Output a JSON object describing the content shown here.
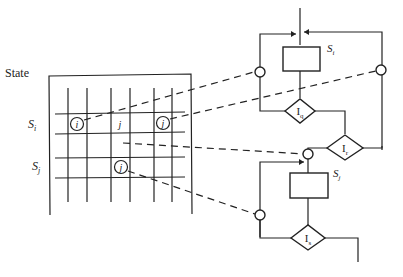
{
  "title": "State",
  "grid": {
    "row_labels": [
      {
        "main": "S",
        "sub": "i"
      },
      {
        "main": "S",
        "sub": "j"
      }
    ],
    "cells": [
      {
        "label": "i",
        "circled": true,
        "row": "S_i"
      },
      {
        "label": "j",
        "circled": false,
        "row": "S_i"
      },
      {
        "label": "j",
        "circled": true,
        "row": "S_i"
      },
      {
        "label": "j",
        "circled": true,
        "row": "S_j"
      }
    ]
  },
  "flowchart": {
    "block1": {
      "label_main": "S",
      "label_sub": "i"
    },
    "diamond_q": {
      "main": "I",
      "sub": "q"
    },
    "diamond_r": {
      "main": "I",
      "sub": "r"
    },
    "block2": {
      "label_main": "S",
      "label_sub": "j"
    },
    "diamond_s": {
      "main": "I",
      "sub": "s"
    }
  },
  "colors": {
    "line": "#222222",
    "background": "#ffffff"
  }
}
